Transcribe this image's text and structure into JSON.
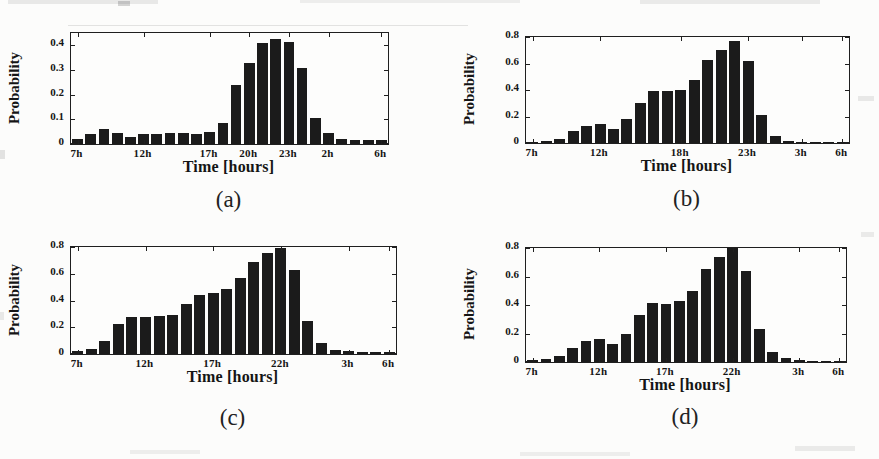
{
  "page": {
    "background_color": "#fcfcfb",
    "ink_color": "#1b1b1b",
    "description_hours_sequence": [
      "7h",
      "8h",
      "9h",
      "10h",
      "11h",
      "12h",
      "13h",
      "14h",
      "15h",
      "16h",
      "17h",
      "18h",
      "19h",
      "20h",
      "21h",
      "22h",
      "23h",
      "0h",
      "1h",
      "2h",
      "3h",
      "4h",
      "5h",
      "6h"
    ]
  },
  "chart_data": [
    {
      "type": "bar",
      "caption": "(a)",
      "xlabel": "Time [hours]",
      "ylabel": "Probability",
      "x_categories": [
        "7h",
        "8h",
        "9h",
        "10h",
        "11h",
        "12h",
        "13h",
        "14h",
        "15h",
        "16h",
        "17h",
        "18h",
        "19h",
        "20h",
        "21h",
        "22h",
        "23h",
        "0h",
        "1h",
        "2h",
        "3h",
        "4h",
        "5h",
        "6h"
      ],
      "values": [
        0.02,
        0.04,
        0.06,
        0.045,
        0.03,
        0.04,
        0.04,
        0.045,
        0.045,
        0.04,
        0.05,
        0.085,
        0.24,
        0.33,
        0.41,
        0.425,
        0.415,
        0.31,
        0.105,
        0.045,
        0.02,
        0.015,
        0.015,
        0.015
      ],
      "xticks": [
        {
          "pos": 0,
          "label": "7h"
        },
        {
          "pos": 5,
          "label": "12h"
        },
        {
          "pos": 10,
          "label": "17h"
        },
        {
          "pos": 13,
          "label": "20h"
        },
        {
          "pos": 16,
          "label": "23h"
        },
        {
          "pos": 19,
          "label": "2h"
        },
        {
          "pos": 23,
          "label": "6h"
        }
      ],
      "ytick_values": [
        0,
        0.1,
        0.2,
        0.3,
        0.4
      ],
      "ytick_labels": [
        "0",
        "0.1",
        "0.2",
        "0.3",
        "0.4"
      ],
      "ylim": [
        0,
        0.45
      ],
      "grid": false,
      "legend": null,
      "bar_color": "#1b1b1b"
    },
    {
      "type": "bar",
      "caption": "(b)",
      "xlabel": "Time [hours]",
      "ylabel": "Probability",
      "x_categories": [
        "7h",
        "8h",
        "9h",
        "10h",
        "11h",
        "12h",
        "13h",
        "14h",
        "15h",
        "16h",
        "17h",
        "18h",
        "19h",
        "20h",
        "21h",
        "22h",
        "23h",
        "0h",
        "1h",
        "2h",
        "3h",
        "4h",
        "5h",
        "6h"
      ],
      "values": [
        0.005,
        0.012,
        0.03,
        0.09,
        0.13,
        0.14,
        0.105,
        0.185,
        0.3,
        0.39,
        0.39,
        0.4,
        0.475,
        0.63,
        0.7,
        0.77,
        0.62,
        0.215,
        0.055,
        0.012,
        0.005,
        0.004,
        0.004,
        0.004
      ],
      "xticks": [
        {
          "pos": 0,
          "label": "7h"
        },
        {
          "pos": 5,
          "label": "12h"
        },
        {
          "pos": 11,
          "label": "18h"
        },
        {
          "pos": 16,
          "label": "23h"
        },
        {
          "pos": 20,
          "label": "3h"
        },
        {
          "pos": 23,
          "label": "6h"
        }
      ],
      "ytick_values": [
        0,
        0.2,
        0.4,
        0.6,
        0.8
      ],
      "ytick_labels": [
        "0",
        "0.2",
        "0.4",
        "0.6",
        "0.8"
      ],
      "ylim": [
        0,
        0.8
      ],
      "grid": false,
      "legend": null,
      "bar_color": "#1b1b1b"
    },
    {
      "type": "bar",
      "caption": "(c)",
      "xlabel": "Time [hours]",
      "ylabel": "Probability",
      "x_categories": [
        "7h",
        "8h",
        "9h",
        "10h",
        "11h",
        "12h",
        "13h",
        "14h",
        "15h",
        "16h",
        "17h",
        "18h",
        "19h",
        "20h",
        "21h",
        "22h",
        "23h",
        "0h",
        "1h",
        "2h",
        "3h",
        "4h",
        "5h",
        "6h"
      ],
      "values": [
        0.025,
        0.04,
        0.1,
        0.225,
        0.28,
        0.275,
        0.285,
        0.295,
        0.375,
        0.445,
        0.455,
        0.49,
        0.565,
        0.685,
        0.755,
        0.79,
        0.625,
        0.245,
        0.08,
        0.03,
        0.02,
        0.015,
        0.015,
        0.012
      ],
      "xticks": [
        {
          "pos": 0,
          "label": "7h"
        },
        {
          "pos": 5,
          "label": "12h"
        },
        {
          "pos": 10,
          "label": "17h"
        },
        {
          "pos": 15,
          "label": "22h"
        },
        {
          "pos": 20,
          "label": "3h"
        },
        {
          "pos": 23,
          "label": "6h"
        }
      ],
      "ytick_values": [
        0,
        0.2,
        0.4,
        0.6,
        0.8
      ],
      "ytick_labels": [
        "0",
        "0.2",
        "0.4",
        "0.6",
        "0.8"
      ],
      "ylim": [
        0,
        0.8
      ],
      "grid": false,
      "legend": null,
      "bar_color": "#1b1b1b"
    },
    {
      "type": "bar",
      "caption": "(d)",
      "xlabel": "Time [hours]",
      "ylabel": "Probability",
      "x_categories": [
        "7h",
        "8h",
        "9h",
        "10h",
        "11h",
        "12h",
        "13h",
        "14h",
        "15h",
        "16h",
        "17h",
        "18h",
        "19h",
        "20h",
        "21h",
        "22h",
        "23h",
        "0h",
        "1h",
        "2h",
        "3h",
        "4h",
        "5h",
        "6h"
      ],
      "values": [
        0.012,
        0.02,
        0.04,
        0.1,
        0.15,
        0.165,
        0.13,
        0.2,
        0.33,
        0.415,
        0.41,
        0.425,
        0.5,
        0.655,
        0.735,
        0.8,
        0.64,
        0.23,
        0.07,
        0.025,
        0.015,
        0.01,
        0.01,
        0.01
      ],
      "xticks": [
        {
          "pos": 0,
          "label": "7h"
        },
        {
          "pos": 5,
          "label": "12h"
        },
        {
          "pos": 10,
          "label": "17h"
        },
        {
          "pos": 15,
          "label": "22h"
        },
        {
          "pos": 20,
          "label": "3h"
        },
        {
          "pos": 23,
          "label": "6h"
        }
      ],
      "ytick_values": [
        0,
        0.2,
        0.4,
        0.6,
        0.8
      ],
      "ytick_labels": [
        "0",
        "0.2",
        "0.4",
        "0.6",
        "0.8"
      ],
      "ylim": [
        0,
        0.8
      ],
      "grid": false,
      "legend": null,
      "bar_color": "#1b1b1b"
    }
  ]
}
